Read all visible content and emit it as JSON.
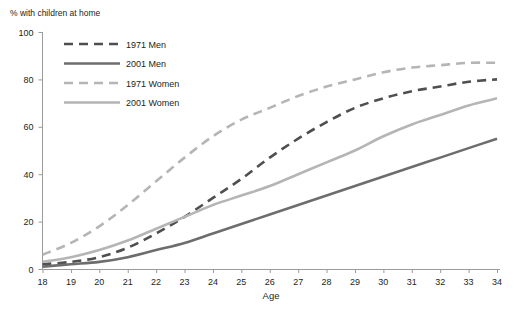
{
  "chart_data": {
    "type": "line",
    "title": "% with children at home",
    "xlabel": "Age",
    "ylabel": "",
    "x": [
      18,
      19,
      20,
      21,
      22,
      23,
      24,
      25,
      26,
      27,
      28,
      29,
      30,
      31,
      32,
      33,
      34
    ],
    "xlim": [
      18,
      34
    ],
    "ylim": [
      0,
      100
    ],
    "yticks": [
      0,
      20,
      40,
      60,
      80,
      100
    ],
    "xticks": [
      18,
      19,
      20,
      21,
      22,
      23,
      24,
      25,
      26,
      27,
      28,
      29,
      30,
      31,
      32,
      33,
      34
    ],
    "grid": false,
    "legend_position": "upper-left-inside",
    "series": [
      {
        "name": "1971 Men",
        "style": "dashed",
        "color": "#4f4f4f",
        "width": 2.6,
        "values": [
          2,
          3,
          5,
          9,
          15,
          22,
          30,
          38,
          47,
          55,
          62,
          68,
          72,
          75,
          77,
          79,
          80
        ]
      },
      {
        "name": "2001 Men",
        "style": "solid",
        "color": "#6d6d6d",
        "width": 2.6,
        "values": [
          1,
          2,
          3,
          5,
          8,
          11,
          15,
          19,
          23,
          27,
          31,
          35,
          39,
          43,
          47,
          51,
          55
        ]
      },
      {
        "name": "1971 Women",
        "style": "dashed",
        "color": "#b5b5b5",
        "width": 2.6,
        "values": [
          6,
          11,
          18,
          27,
          37,
          47,
          56,
          63,
          68,
          73,
          77,
          80,
          83,
          85,
          86,
          87,
          87
        ]
      },
      {
        "name": "2001 Women",
        "style": "solid",
        "color": "#b5b5b5",
        "width": 2.6,
        "values": [
          3,
          5,
          8,
          12,
          17,
          22,
          27,
          31,
          35,
          40,
          45,
          50,
          56,
          61,
          65,
          69,
          72
        ]
      }
    ]
  },
  "legend": {
    "items": [
      {
        "label": "1971 Men"
      },
      {
        "label": "2001 Men"
      },
      {
        "label": "1971 Women"
      },
      {
        "label": "2001 Women"
      }
    ]
  },
  "axes": {
    "y_title": "% with children at home",
    "x_title": "Age",
    "y_tick_labels": [
      "100",
      "80",
      "60",
      "40",
      "20",
      "0"
    ],
    "x_tick_labels": [
      "18",
      "19",
      "20",
      "21",
      "22",
      "23",
      "24",
      "25",
      "26",
      "27",
      "28",
      "29",
      "30",
      "31",
      "32",
      "33",
      "34"
    ]
  }
}
